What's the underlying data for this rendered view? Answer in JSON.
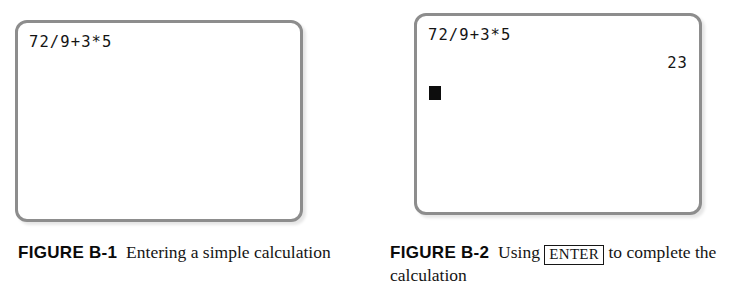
{
  "page": {
    "background_color": "#ffffff",
    "bezel_color": "#8d8d8d",
    "text_color": "#141414"
  },
  "figures": [
    {
      "id": "figure-b-1",
      "screen": {
        "expression": "72/9+3*5",
        "result": "",
        "cursor_visible": false
      },
      "caption": {
        "label": "FIGURE B-1",
        "text_before_key": "Entering a simple calculation",
        "key": "",
        "text_after_key": ""
      }
    },
    {
      "id": "figure-b-2",
      "screen": {
        "expression": "72/9+3*5",
        "result": "23",
        "cursor_visible": true
      },
      "caption": {
        "label": "FIGURE B-2",
        "text_before_key": "Using",
        "key": "ENTER",
        "text_after_key": "to complete the calculation"
      }
    }
  ]
}
